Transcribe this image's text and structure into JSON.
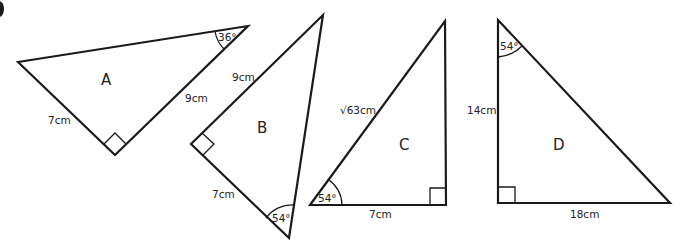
{
  "diagram": {
    "question_marker": "partial bullet at top-left edge",
    "triangles": [
      {
        "name": "A",
        "labels": {
          "side_1": "7cm",
          "side_2": "9cm",
          "angle": "36°"
        },
        "right_angle": true
      },
      {
        "name": "B",
        "labels": {
          "side_1": "9cm",
          "side_2": "7cm",
          "angle": "54°"
        },
        "right_angle": true
      },
      {
        "name": "C",
        "labels": {
          "hypotenuse": "√63cm",
          "base": "7cm",
          "angle": "54°"
        },
        "right_angle": true
      },
      {
        "name": "D",
        "labels": {
          "height": "14cm",
          "base": "18cm",
          "angle": "54°"
        },
        "right_angle": true
      }
    ]
  }
}
